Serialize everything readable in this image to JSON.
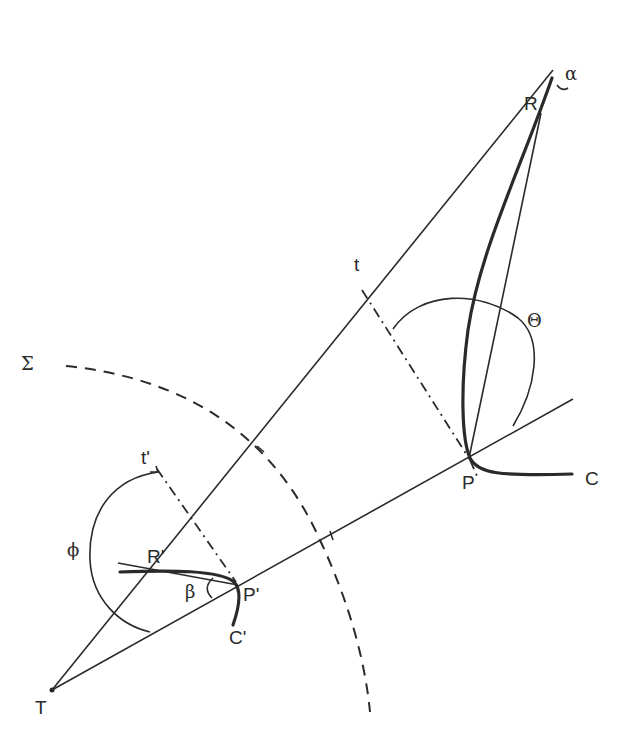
{
  "labels": {
    "alpha": "α",
    "R": "R",
    "t": "t",
    "Theta": "Θ",
    "Sigma": "Σ",
    "P": "P",
    "C": "C",
    "t_prime": "t'",
    "phi": "ϕ",
    "R_prime": "R'",
    "beta": "β",
    "P_prime": "P'",
    "C_prime": "C'",
    "T": "T"
  },
  "colors": {
    "stroke": "#2a2a2a",
    "background": "#ffffff"
  }
}
